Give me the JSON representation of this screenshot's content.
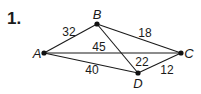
{
  "problem_number": "1.",
  "graph": {
    "vertices": [
      {
        "id": "A",
        "label": "A",
        "x": 44,
        "y": 53,
        "label_x": 37,
        "label_y": 58
      },
      {
        "id": "B",
        "label": "B",
        "x": 97,
        "y": 24,
        "label_x": 97,
        "label_y": 19
      },
      {
        "id": "C",
        "label": "C",
        "x": 181,
        "y": 53,
        "label_x": 189,
        "label_y": 58
      },
      {
        "id": "D",
        "label": "D",
        "x": 138,
        "y": 73,
        "label_x": 138,
        "label_y": 88
      }
    ],
    "edges": [
      {
        "from": "A",
        "to": "B",
        "weight": "32",
        "label_x": 69,
        "label_y": 36
      },
      {
        "from": "B",
        "to": "C",
        "weight": "18",
        "label_x": 145,
        "label_y": 37
      },
      {
        "from": "A",
        "to": "C",
        "weight": "45",
        "label_x": 99,
        "label_y": 51
      },
      {
        "from": "B",
        "to": "D",
        "weight": "22",
        "label_x": 142,
        "label_y": 66
      },
      {
        "from": "A",
        "to": "D",
        "weight": "40",
        "label_x": 92,
        "label_y": 74
      },
      {
        "from": "D",
        "to": "C",
        "weight": "12",
        "label_x": 167,
        "label_y": 74
      }
    ]
  }
}
